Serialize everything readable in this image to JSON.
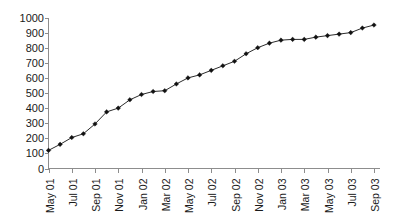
{
  "chart_data": {
    "type": "line",
    "title": "",
    "subtitle": "",
    "xlabel": "",
    "ylabel": "",
    "grid": false,
    "legend": false,
    "legend_position": "none",
    "series_color": "#111111",
    "axis_color": "#8d8d8d",
    "marker": "diamond",
    "ylim": [
      0,
      1000
    ],
    "y_ticks": [
      0,
      100,
      200,
      300,
      400,
      500,
      600,
      700,
      800,
      900,
      1000
    ],
    "y_tick_labels": [
      "0",
      "100",
      "200",
      "300",
      "400",
      "500",
      "600",
      "700",
      "800",
      "900",
      "1000"
    ],
    "x_tick_labels": [
      "May 01",
      "Jul 01",
      "Sep 01",
      "Nov 01",
      "Jan 02",
      "Mar 02",
      "May 02",
      "Jul 02",
      "Sep 02",
      "Nov 02",
      "Jan 03",
      "Mar 03",
      "May 03",
      "Jul 03",
      "Sep 03"
    ],
    "x_tick_label_rotation": -90,
    "x": [
      "May 01",
      "Jun 01",
      "Jul 01",
      "Aug 01",
      "Sep 01",
      "Oct 01",
      "Nov 01",
      "Dec 01",
      "Jan 02",
      "Feb 02",
      "Mar 02",
      "Apr 02",
      "May 02",
      "Jun 02",
      "Jul 02",
      "Aug 02",
      "Sep 02",
      "Oct 02",
      "Nov 02",
      "Dec 02",
      "Jan 03",
      "Feb 03",
      "Mar 03",
      "Apr 03",
      "May 03",
      "Jun 03",
      "Jul 03",
      "Aug 03",
      "Sep 03"
    ],
    "values": [
      120,
      160,
      205,
      230,
      295,
      375,
      400,
      455,
      490,
      510,
      515,
      560,
      600,
      620,
      650,
      680,
      710,
      760,
      800,
      830,
      850,
      855,
      855,
      870,
      880,
      890,
      900,
      930,
      950
    ],
    "series": [
      {
        "name": "series-1",
        "values": [
          120,
          160,
          205,
          230,
          295,
          375,
          400,
          455,
          490,
          510,
          515,
          560,
          600,
          620,
          650,
          680,
          710,
          760,
          800,
          830,
          850,
          855,
          855,
          870,
          880,
          890,
          900,
          930,
          950
        ]
      }
    ]
  }
}
